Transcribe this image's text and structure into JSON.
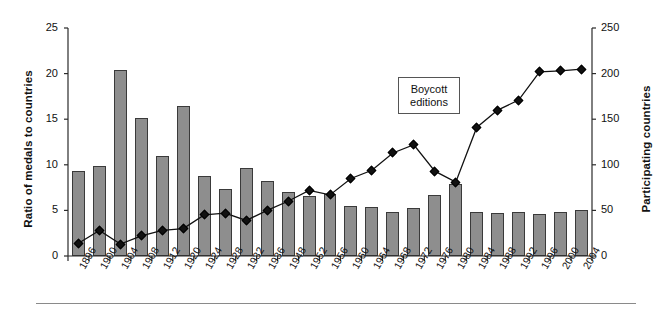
{
  "chart_data": {
    "type": "bar",
    "title": "",
    "subtitle": "",
    "xlabel": "",
    "ylabel": "Ratio of medals to countries",
    "y2label": "Participating countries",
    "ylim": [
      0,
      25
    ],
    "y2lim": [
      0,
      250
    ],
    "yticks": [
      0,
      5,
      10,
      15,
      20,
      25
    ],
    "y2ticks": [
      0,
      50,
      100,
      150,
      200,
      250
    ],
    "grid": false,
    "legend": "none",
    "categories": [
      "1896",
      "1900",
      "1904",
      "1908",
      "1912",
      "1920",
      "1924",
      "1928",
      "1932",
      "1936",
      "1948",
      "1952",
      "1956",
      "1960",
      "1964",
      "1968",
      "1972",
      "1976",
      "1980",
      "1984",
      "1988",
      "1992",
      "1996",
      "2000",
      "2004"
    ],
    "series": [
      {
        "name": "Ratio of medals to countries",
        "type": "bar",
        "axis": "left",
        "color": "#8e8e8e",
        "values": [
          9.3,
          9.9,
          20.4,
          15.1,
          11.0,
          16.5,
          8.8,
          7.3,
          9.7,
          8.2,
          7.0,
          6.6,
          6.8,
          5.5,
          5.4,
          4.8,
          5.3,
          6.7,
          7.9,
          4.8,
          4.7,
          4.8,
          4.6,
          4.8,
          5.0
        ]
      },
      {
        "name": "Participating countries",
        "type": "line",
        "axis": "right",
        "color": "#111111",
        "marker": "diamond",
        "values": [
          14,
          28,
          13,
          22,
          28,
          30,
          45,
          47,
          39,
          50,
          60,
          72,
          67,
          85,
          94,
          113,
          122,
          93,
          81,
          141,
          160,
          171,
          202,
          203,
          205
        ]
      }
    ],
    "annotations": [
      {
        "id": "boycott-note",
        "line1": "Boycott",
        "line2": "editions"
      }
    ]
  }
}
